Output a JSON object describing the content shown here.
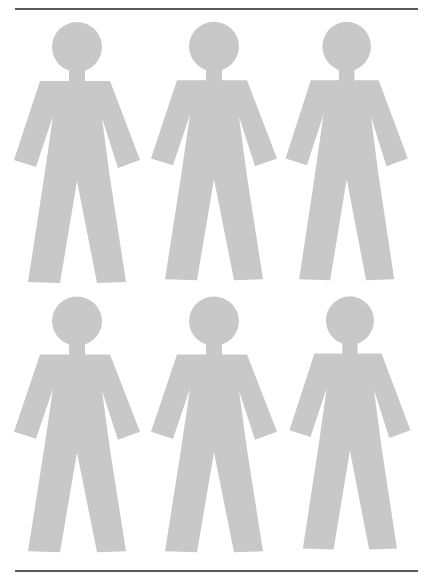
{
  "canvas": {
    "width": 432,
    "height": 578,
    "background": "#ffffff"
  },
  "rules": {
    "color": "#5a5a5a",
    "top": {
      "y": 8
    },
    "bottom": {
      "y": 570
    }
  },
  "figure_style": {
    "fill": "#c8c8c8"
  },
  "figures": [
    {
      "id": "figure-1",
      "row": 1,
      "col": 1,
      "dx": 0,
      "dy": 0,
      "sx": 1.0,
      "sy": 1.0
    },
    {
      "id": "figure-2",
      "row": 1,
      "col": 2,
      "dx": 137,
      "dy": 0,
      "sx": 1.0,
      "sy": 0.99
    },
    {
      "id": "figure-3",
      "row": 1,
      "col": 3,
      "dx": 272,
      "dy": 0,
      "sx": 0.97,
      "sy": 0.99
    },
    {
      "id": "figure-4",
      "row": 2,
      "col": 1,
      "dx": 0,
      "dy": 275,
      "sx": 1.0,
      "sy": 0.98
    },
    {
      "id": "figure-5",
      "row": 2,
      "col": 2,
      "dx": 137,
      "dy": 275,
      "sx": 1.0,
      "sy": 0.98
    },
    {
      "id": "figure-6",
      "row": 2,
      "col": 3,
      "dx": 276,
      "dy": 275,
      "sx": 0.96,
      "sy": 0.97
    }
  ]
}
